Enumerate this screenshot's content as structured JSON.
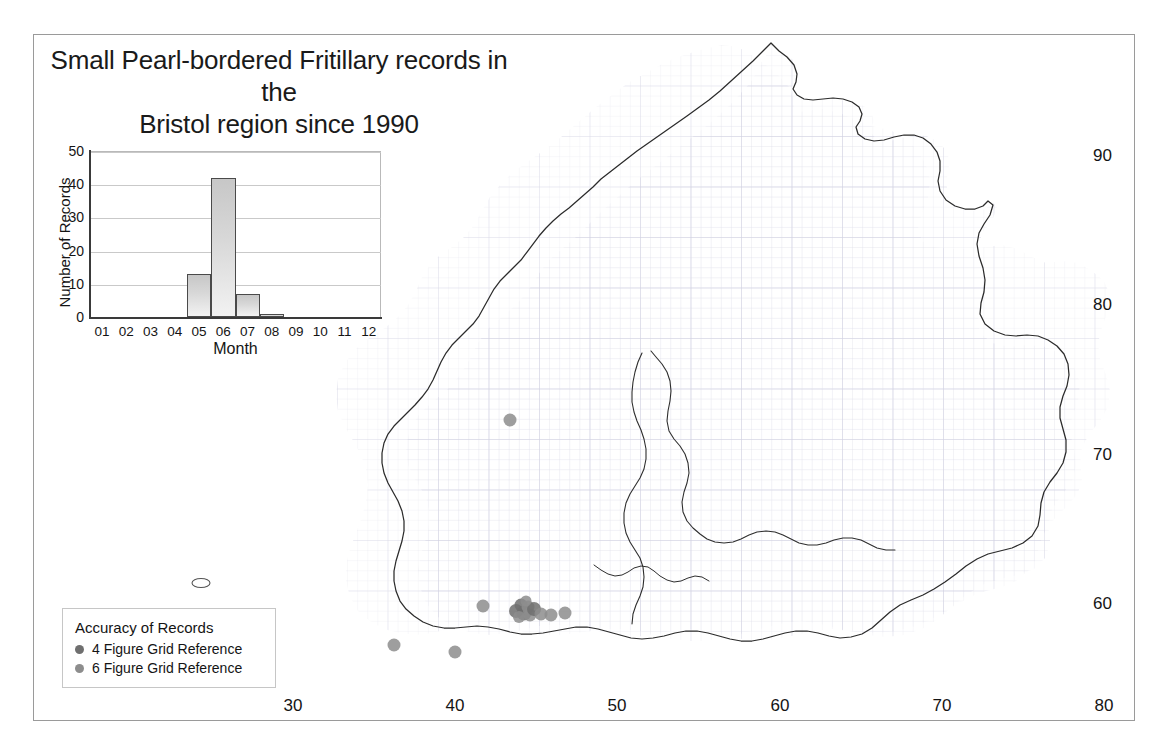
{
  "title": {
    "line1": "Small Pearl-bordered Fritillary records in the",
    "line2": "Bristol region since 1990"
  },
  "colors": {
    "frame_border": "#9a9a9a",
    "map_outline": "#262626",
    "grid": "#d9d9e4",
    "point_4fig": "#6f6f6f",
    "point_6fig": "#8d8d8d",
    "bar_fill": "#d8d8d8",
    "bar_edge": "#4a4a4a"
  },
  "map": {
    "x_axis": {
      "ticks": [
        "30",
        "40",
        "50",
        "60",
        "70",
        "80"
      ],
      "tick_px": [
        293,
        455,
        617,
        780,
        942,
        1104
      ]
    },
    "y_axis": {
      "ticks": [
        "90",
        "80",
        "70",
        "60"
      ],
      "tick_px": [
        156,
        305,
        455,
        604
      ]
    }
  },
  "chart_data": {
    "type": "bar",
    "title": "",
    "xlabel": "Month",
    "ylabel": "Number of Records",
    "categories": [
      "01",
      "02",
      "03",
      "04",
      "05",
      "06",
      "07",
      "08",
      "09",
      "10",
      "11",
      "12"
    ],
    "values": [
      0,
      0,
      0,
      0,
      13,
      42,
      7,
      1,
      0,
      0,
      0,
      0
    ],
    "ylim": [
      0,
      50
    ],
    "yticks": [
      0,
      10,
      20,
      30,
      40,
      50
    ],
    "grid": true,
    "legend": "none"
  },
  "legend": {
    "title": "Accuracy of Records",
    "items": [
      {
        "label": "4 Figure Grid Reference",
        "color": "#6f6f6f",
        "size": 9
      },
      {
        "label": "6 Figure Grid Reference",
        "color": "#8d8d8d",
        "size": 9
      }
    ]
  },
  "records": {
    "points": [
      {
        "x": 510,
        "y": 420,
        "r": 6.5,
        "accuracy": "6 Figure Grid Reference"
      },
      {
        "x": 483,
        "y": 606,
        "r": 6.5,
        "accuracy": "6 Figure Grid Reference"
      },
      {
        "x": 394,
        "y": 645,
        "r": 6.5,
        "accuracy": "6 Figure Grid Reference"
      },
      {
        "x": 455,
        "y": 652,
        "r": 6.5,
        "accuracy": "6 Figure Grid Reference"
      },
      {
        "x": 516,
        "y": 611,
        "r": 7.0,
        "accuracy": "4 Figure Grid Reference"
      },
      {
        "x": 521,
        "y": 605,
        "r": 6.5,
        "accuracy": "4 Figure Grid Reference"
      },
      {
        "x": 524,
        "y": 613,
        "r": 7.5,
        "accuracy": "4 Figure Grid Reference"
      },
      {
        "x": 528,
        "y": 607,
        "r": 6.5,
        "accuracy": "6 Figure Grid Reference"
      },
      {
        "x": 530,
        "y": 615,
        "r": 6.5,
        "accuracy": "6 Figure Grid Reference"
      },
      {
        "x": 534,
        "y": 609,
        "r": 7.0,
        "accuracy": "4 Figure Grid Reference"
      },
      {
        "x": 519,
        "y": 617,
        "r": 6.0,
        "accuracy": "6 Figure Grid Reference"
      },
      {
        "x": 526,
        "y": 601,
        "r": 5.5,
        "accuracy": "6 Figure Grid Reference"
      },
      {
        "x": 541,
        "y": 614,
        "r": 6.5,
        "accuracy": "6 Figure Grid Reference"
      },
      {
        "x": 551,
        "y": 615,
        "r": 6.5,
        "accuracy": "6 Figure Grid Reference"
      },
      {
        "x": 565,
        "y": 613,
        "r": 6.5,
        "accuracy": "6 Figure Grid Reference"
      }
    ]
  }
}
